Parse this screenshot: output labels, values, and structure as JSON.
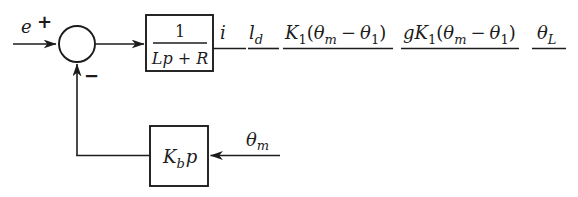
{
  "figure": {
    "type": "control-block-diagram",
    "background": "#ffffff",
    "ink_color": "#1c1c1c"
  },
  "labels": {
    "input": "e",
    "plus": "+",
    "minus": "−",
    "block1": {
      "num": "1",
      "den": "Lp + R"
    },
    "i": "i",
    "ld": {
      "base": "l",
      "sub": "d"
    },
    "k1": {
      "K": "K",
      "Ksub": "1",
      "open": "(",
      "theta_a": "θ",
      "theta_a_sub": "m",
      "minus": "−",
      "theta_b": "θ",
      "theta_b_sub": "1",
      "close": ")"
    },
    "gk1": {
      "g": "g",
      "K": "K",
      "Ksub": "1",
      "open": "(",
      "theta_a": "θ",
      "theta_a_sub": "m",
      "minus": "−",
      "theta_b": "θ",
      "theta_b_sub": "1",
      "close": ")"
    },
    "theta_l": {
      "base": "θ",
      "sub": "L"
    },
    "block2": {
      "K": "K",
      "Ksub": "b",
      "p": "p"
    },
    "theta_m": {
      "base": "θ",
      "sub": "m"
    }
  }
}
